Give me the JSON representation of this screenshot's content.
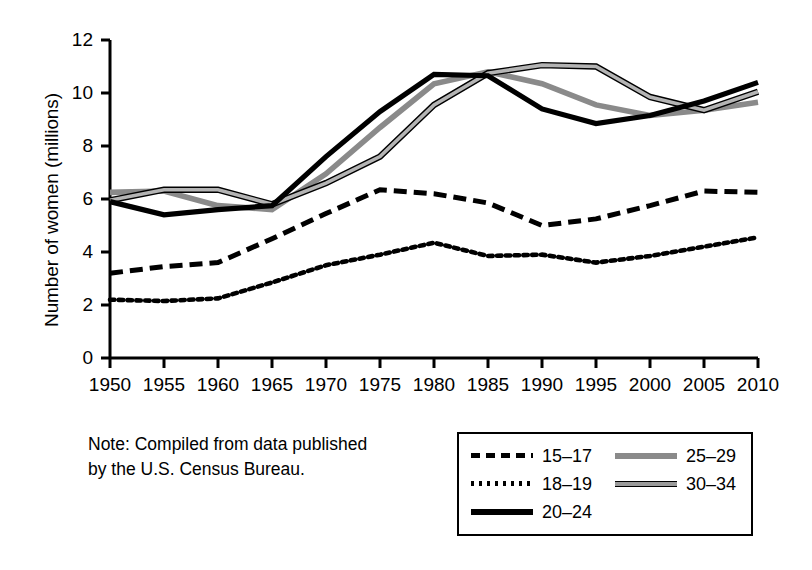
{
  "chart_data": {
    "type": "line",
    "title": "",
    "xlabel": "",
    "ylabel": "Number of women (millions)",
    "xlim": [
      1950,
      2010
    ],
    "ylim": [
      0,
      12
    ],
    "ytick_labels": [
      "12",
      "10",
      "8",
      "6",
      "4",
      "2",
      "0"
    ],
    "ytick_values": [
      12,
      10,
      8,
      6,
      4,
      2,
      0
    ],
    "grid": false,
    "legend_position": "bottom-right",
    "x": [
      1950,
      1955,
      1960,
      1965,
      1970,
      1975,
      1980,
      1985,
      1990,
      1995,
      2000,
      2005,
      2010
    ],
    "xtick_labels": [
      "1950",
      "1955",
      "1960",
      "1965",
      "1970",
      "1975",
      "1980",
      "1985",
      "1990",
      "1995",
      "2000",
      "2005",
      "2010"
    ],
    "series": [
      {
        "name": "15–17",
        "style": "dashed",
        "color": "#000000",
        "values": [
          3.2,
          3.45,
          3.6,
          4.5,
          5.45,
          6.35,
          6.2,
          5.85,
          5.0,
          5.25,
          5.75,
          6.3,
          6.25
        ]
      },
      {
        "name": "18–19",
        "style": "dotted",
        "color": "#000000",
        "values": [
          2.2,
          2.15,
          2.25,
          2.85,
          3.5,
          3.9,
          4.35,
          3.85,
          3.9,
          3.6,
          3.85,
          4.2,
          4.55
        ]
      },
      {
        "name": "20–24",
        "style": "solid",
        "color": "#000000",
        "values": [
          5.9,
          5.4,
          5.6,
          5.75,
          7.6,
          9.3,
          10.7,
          10.65,
          9.4,
          8.85,
          9.15,
          9.7,
          10.4
        ]
      },
      {
        "name": "25–29",
        "style": "gray",
        "color": "#8a8a8a",
        "values": [
          6.25,
          6.3,
          5.75,
          5.6,
          6.95,
          8.7,
          10.35,
          10.8,
          10.35,
          9.55,
          9.15,
          9.35,
          9.65
        ]
      },
      {
        "name": "30–34",
        "style": "outlined",
        "color": "#9a9a9a",
        "values": [
          5.95,
          6.35,
          6.35,
          5.8,
          6.6,
          7.6,
          9.55,
          10.75,
          11.05,
          11.0,
          9.85,
          9.35,
          10.05
        ]
      }
    ],
    "note": {
      "line1": "Note: Compiled from data published",
      "line2": "by the U.S. Census Bureau."
    }
  },
  "legend": {
    "left_entries": [
      {
        "label": "15–17",
        "style": "dashed"
      },
      {
        "label": "18–19",
        "style": "dotted"
      },
      {
        "label": "20–24",
        "style": "solid"
      }
    ],
    "right_entries": [
      {
        "label": "25–29",
        "style": "gray"
      },
      {
        "label": "30–34",
        "style": "outlined"
      }
    ]
  },
  "colors": {
    "axis": "#000000",
    "series_black": "#000000",
    "series_gray": "#8a8a8a",
    "series_outlined_fill": "#9a9a9a",
    "background": "#ffffff"
  }
}
